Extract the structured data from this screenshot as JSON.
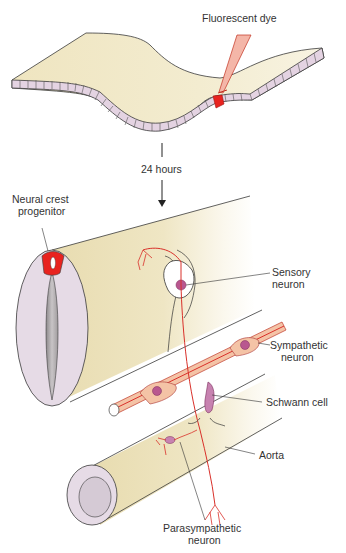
{
  "figure": {
    "colors": {
      "tissue": "#f1e9c8",
      "cells": "#e4d3e2",
      "dye": "#e8231f",
      "axon": "#d9302a",
      "neuron_body": "#f4c3a6",
      "nucleus": "#b9578f",
      "outline": "#3a3a3a"
    },
    "labels": {
      "fluorescent_dye": "Fluorescent dye",
      "time": "24 hours",
      "neural_crest_1": "Neural crest",
      "neural_crest_2": "progenitor",
      "sensory_1": "Sensory",
      "sensory_2": "neuron",
      "sympathetic_1": "Sympathetic",
      "sympathetic_2": "neuron",
      "schwann": "Schwann cell",
      "aorta": "Aorta",
      "parasympathetic_1": "Parasympathetic",
      "parasympathetic_2": "neuron"
    }
  }
}
